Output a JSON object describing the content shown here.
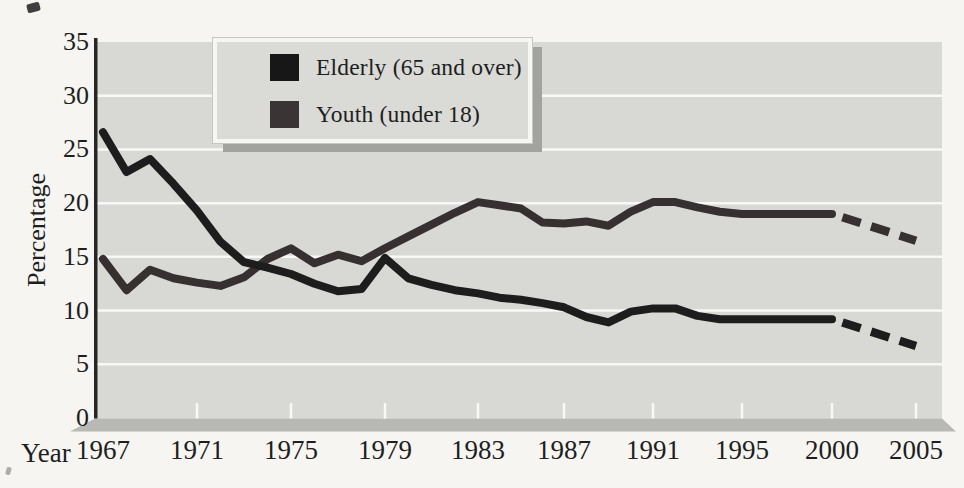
{
  "figure": {
    "kind": "scanned textbook line chart",
    "background_color": "#f6f5f1",
    "plot_background_color": "#d8d8d5",
    "gridline_color": "#f8f8f6",
    "base_shadow_color": "#b8b8b4",
    "axis_line_color": "#262626"
  },
  "axes": {
    "y_title": "Percentage",
    "x_title": "Year",
    "y_tick_labels": [
      "35",
      "30",
      "25",
      "20",
      "15",
      "10",
      "5",
      "0"
    ],
    "x_tick_labels": [
      "1967",
      "1971",
      "1975",
      "1979",
      "1983",
      "1987",
      "1991",
      "1995",
      "2000",
      "2005"
    ]
  },
  "legend": {
    "items": [
      {
        "label": "Elderly (65 and over)",
        "swatch_color": "#171717"
      },
      {
        "label": "Youth (under 18)",
        "swatch_color": "#3b3434"
      }
    ]
  },
  "chart_data": {
    "type": "line",
    "title": "",
    "xlabel": "Year",
    "ylabel": "Percentage",
    "ylim": [
      0,
      35
    ],
    "y_ticks": [
      0,
      5,
      10,
      15,
      20,
      25,
      30,
      35
    ],
    "x_ticks": [
      1967,
      1971,
      1975,
      1979,
      1983,
      1987,
      1991,
      1995,
      2000,
      2005
    ],
    "grid": true,
    "legend_position": "upper left inset",
    "x": [
      1967,
      1968,
      1969,
      1970,
      1971,
      1972,
      1973,
      1974,
      1975,
      1976,
      1977,
      1978,
      1979,
      1980,
      1981,
      1982,
      1983,
      1984,
      1985,
      1986,
      1987,
      1988,
      1989,
      1990,
      1991,
      1992,
      1993,
      1994,
      1995,
      1996,
      1997,
      1998,
      1999,
      2000
    ],
    "series": [
      {
        "name": "Elderly (65 and over)",
        "style": "solid",
        "color": "#1d1d1d",
        "values": [
          26.6,
          22.9,
          24.1,
          21.8,
          19.3,
          16.4,
          14.5,
          14.0,
          13.4,
          12.5,
          11.8,
          12.0,
          14.9,
          13.0,
          12.4,
          11.9,
          11.6,
          11.2,
          11.0,
          10.7,
          10.3,
          9.4,
          8.9,
          9.9,
          10.2,
          10.2,
          9.5,
          9.2,
          9.2,
          9.2,
          9.2,
          9.2,
          9.2,
          9.2
        ]
      },
      {
        "name": "Youth (under 18)",
        "style": "solid",
        "color": "#363030",
        "values": [
          14.8,
          11.9,
          13.8,
          13.0,
          12.6,
          12.3,
          13.1,
          14.8,
          15.8,
          14.4,
          15.2,
          14.6,
          15.8,
          16.9,
          18.0,
          19.1,
          20.1,
          19.8,
          19.5,
          18.2,
          18.1,
          18.3,
          17.9,
          19.2,
          20.1,
          20.1,
          19.6,
          19.2,
          19.0,
          19.0,
          19.0,
          19.0,
          19.0,
          19.0
        ]
      },
      {
        "name": "Elderly (65 and over) projection",
        "style": "dashed",
        "color": "#1d1d1d",
        "x": [
          2000,
          2005
        ],
        "values": [
          9.2,
          6.7
        ]
      },
      {
        "name": "Youth (under 18) projection",
        "style": "dashed",
        "color": "#363030",
        "x": [
          2000,
          2005
        ],
        "values": [
          19.0,
          16.5
        ]
      }
    ]
  }
}
